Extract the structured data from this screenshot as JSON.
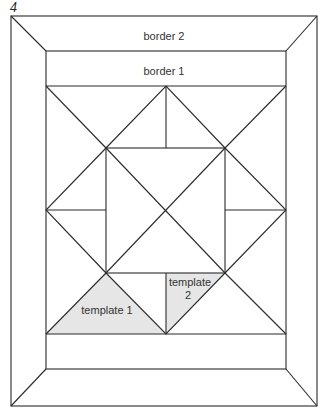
{
  "figure": {
    "number": "4",
    "labels": {
      "border_outer": "border 2",
      "border_inner": "border 1",
      "template_1": "template 1",
      "template_2_line1": "template",
      "template_2_line2": "2"
    },
    "colors": {
      "line": "#2a2a2a",
      "template_fill": "#e6e6e6",
      "background": "#ffffff"
    }
  }
}
